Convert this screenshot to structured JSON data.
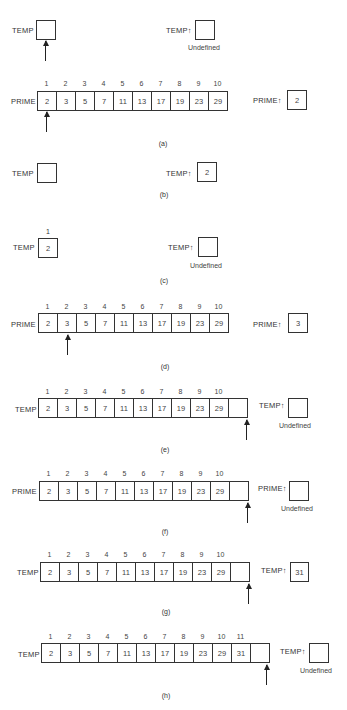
{
  "figure": {
    "labels": {
      "temp": "TEMP",
      "temp_up": "TEMP↑",
      "prime": "PRIME",
      "prime_up": "PRIME↑",
      "undefined": "Undefined"
    },
    "indices_10": [
      "1",
      "2",
      "3",
      "4",
      "5",
      "6",
      "7",
      "8",
      "9",
      "10"
    ],
    "indices_11": [
      "1",
      "2",
      "3",
      "4",
      "5",
      "6",
      "7",
      "8",
      "9",
      "10",
      "11"
    ],
    "primes_10": [
      "2",
      "3",
      "5",
      "7",
      "11",
      "13",
      "17",
      "19",
      "23",
      "29"
    ],
    "primes_11": [
      "2",
      "3",
      "5",
      "7",
      "11",
      "13",
      "17",
      "19",
      "23",
      "29",
      "31"
    ],
    "panels": {
      "a": {
        "caption": "(a)",
        "prime_up_value": "2"
      },
      "b": {
        "caption": "(b)",
        "temp_up_value": "2"
      },
      "c": {
        "caption": "(c)",
        "temp_index": "1",
        "temp_value": "2"
      },
      "d": {
        "caption": "(d)",
        "prime_up_value": "3"
      },
      "e": {
        "caption": "(e)"
      },
      "f": {
        "caption": "(f)"
      },
      "g": {
        "caption": "(g)",
        "temp_up_value": "31"
      },
      "h": {
        "caption": "(h)"
      }
    }
  }
}
